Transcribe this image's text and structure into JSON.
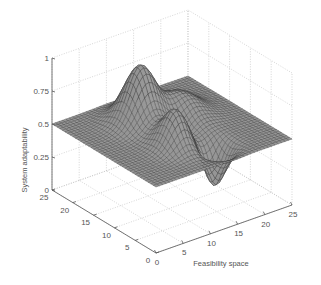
{
  "chart_data": {
    "type": "surface3d",
    "title": "",
    "xlabel": "Feasibility space",
    "ylabel": "",
    "zlabel": "System adaptability",
    "x_ticks": [
      0,
      5,
      10,
      15,
      20,
      25
    ],
    "y_ticks": [
      0,
      5,
      10,
      15,
      20,
      25
    ],
    "z_ticks": [
      0,
      0.25,
      0.5,
      0.75,
      1
    ],
    "z_tick_labels": [
      "0",
      "0.25",
      "0.5",
      "0.75",
      "1"
    ],
    "xlim": [
      0,
      25
    ],
    "ylim": [
      0,
      25
    ],
    "zlim": [
      0,
      1
    ],
    "grid": true,
    "baseline": 0.5,
    "surface_description": "Mesh surface over a 25x25 grid, flat at z=0.5 near the edges, with a tall peak (~0.93) toward the back-left, a secondary peak (~0.78) in the middle, a ridge toward the back-right, and a trough (~0.2) toward the front-right",
    "features": [
      {
        "kind": "peak",
        "x": 10.5,
        "y": 17.5,
        "z": 0.93
      },
      {
        "kind": "peak",
        "x": 10.0,
        "y": 8.5,
        "z": 0.78
      },
      {
        "kind": "ridge",
        "x": 17.0,
        "y": 16.0,
        "z": 0.66
      },
      {
        "kind": "trough",
        "x": 14.5,
        "y": 5.0,
        "z": 0.2
      }
    ],
    "mesh_color": "#3a3a3a",
    "face_color": "#9a9a9a"
  }
}
